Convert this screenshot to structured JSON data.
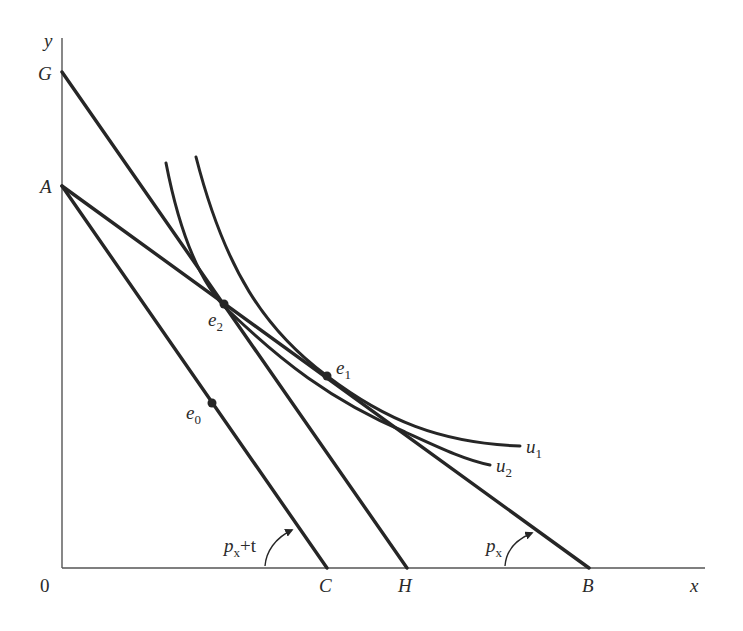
{
  "figure": {
    "type": "economics-diagram"
  },
  "axes": {
    "origin_label": "0",
    "x_label": "x",
    "y_label": "y"
  },
  "intercepts": {
    "y_axis": [
      {
        "label": "G"
      },
      {
        "label": "A"
      }
    ],
    "x_axis": [
      {
        "label": "C"
      },
      {
        "label": "H"
      },
      {
        "label": "B"
      }
    ]
  },
  "budget_lines": [
    {
      "name": "AB",
      "from": "A",
      "to": "B",
      "slope_label": "p",
      "slope_sub": "x",
      "slope_suffix": ""
    },
    {
      "name": "AC",
      "from": "A",
      "to": "C",
      "slope_label": "p",
      "slope_sub": "x",
      "slope_suffix": "+t"
    },
    {
      "name": "GH",
      "from": "G",
      "to": "H"
    }
  ],
  "indifference_curves": [
    {
      "label": "u",
      "sub": "1"
    },
    {
      "label": "u",
      "sub": "2"
    }
  ],
  "points": [
    {
      "label": "e",
      "sub": "0"
    },
    {
      "label": "e",
      "sub": "1"
    },
    {
      "label": "e",
      "sub": "2"
    }
  ],
  "colors": {
    "ink": "#262626",
    "axis": "#555555",
    "background": "#ffffff"
  }
}
